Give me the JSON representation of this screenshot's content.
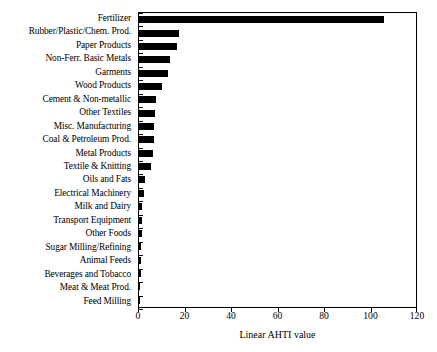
{
  "chart_data": {
    "type": "bar",
    "orientation": "horizontal",
    "title": "",
    "xlabel": "Linear AHTI value",
    "ylabel": "",
    "xlim": [
      0,
      120
    ],
    "xticks": [
      0,
      20,
      40,
      60,
      80,
      100,
      120
    ],
    "grid": false,
    "legend": null,
    "bar_color": "#000000",
    "categories": [
      "Fertilizer",
      "Rubber/Plastic/Chem. Prod.",
      "Paper Products",
      "Non-Ferr. Basic Metals",
      "Garments",
      "Wood Products",
      "Cement & Non-metallic",
      "Other Textiles",
      "Misc. Manufacturing",
      "Coal & Petroleum Prod.",
      "Metal Products",
      "Textile & Knitting",
      "Oils and Fats",
      "Electrical Machinery",
      "Milk and Dairy",
      "Transport Equipment",
      "Other Foods",
      "Sugar Milling/Refining",
      "Animal Feeds",
      "Beverages and Tobacco",
      "Meat & Meat Prod.",
      "Feed Milling"
    ],
    "values": [
      105.4,
      17.2,
      16.5,
      13.3,
      12.3,
      10.1,
      7.1,
      7.0,
      6.6,
      6.3,
      6.0,
      5.2,
      2.6,
      2.2,
      1.5,
      1.4,
      1.3,
      0.9,
      0.8,
      0.7,
      0.6,
      0.1
    ]
  }
}
